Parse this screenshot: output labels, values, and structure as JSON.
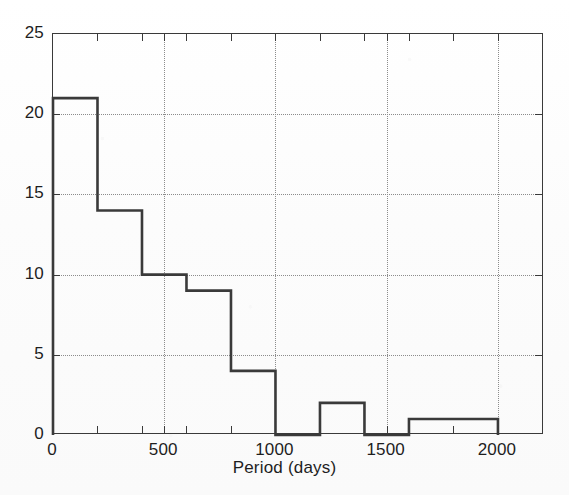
{
  "figure": {
    "background_color": "#fdfdfd",
    "line_color": "#3a3a3a",
    "grid_color": "#8c8c8c"
  },
  "chart_data": {
    "type": "bar",
    "title": "",
    "subtitle": "",
    "xlabel": "Period (days)",
    "ylabel": "",
    "xlim": [
      0,
      2207
    ],
    "ylim": [
      0,
      25
    ],
    "grid": true,
    "legend": null,
    "bin_width": 200,
    "bin_edges": [
      0,
      200,
      400,
      600,
      800,
      1000,
      1200,
      1400,
      1600,
      1800,
      2000
    ],
    "categories": [
      "0-200",
      "200-400",
      "400-600",
      "600-800",
      "800-1000",
      "1000-1200",
      "1200-1400",
      "1400-1600",
      "1600-1800",
      "1800-2000"
    ],
    "values": [
      21,
      14,
      10,
      9,
      4,
      0,
      2,
      0,
      1,
      1
    ],
    "bars": [
      {
        "x0": 0,
        "x1": 200,
        "y": 21
      },
      {
        "x0": 200,
        "x1": 400,
        "y": 14
      },
      {
        "x0": 400,
        "x1": 600,
        "y": 10
      },
      {
        "x0": 600,
        "x1": 800,
        "y": 9
      },
      {
        "x0": 800,
        "x1": 1000,
        "y": 4
      },
      {
        "x0": 1000,
        "x1": 1200,
        "y": 0
      },
      {
        "x0": 1200,
        "x1": 1400,
        "y": 2
      },
      {
        "x0": 1400,
        "x1": 1600,
        "y": 0
      },
      {
        "x0": 1600,
        "x1": 1800,
        "y": 1
      },
      {
        "x0": 1800,
        "x1": 2000,
        "y": 1
      }
    ],
    "xticks": [
      0,
      500,
      1000,
      1500,
      2000
    ],
    "xtick_labels": [
      "0",
      "500",
      "1000",
      "1500",
      "2000"
    ],
    "xticks_minor": [
      200,
      400,
      600,
      800,
      1200,
      1400,
      1600,
      1800,
      2000
    ],
    "yticks": [
      0,
      5,
      10,
      15,
      20,
      25
    ],
    "ytick_labels": [
      "0",
      "5",
      "10",
      "15",
      "20",
      "25"
    ]
  }
}
